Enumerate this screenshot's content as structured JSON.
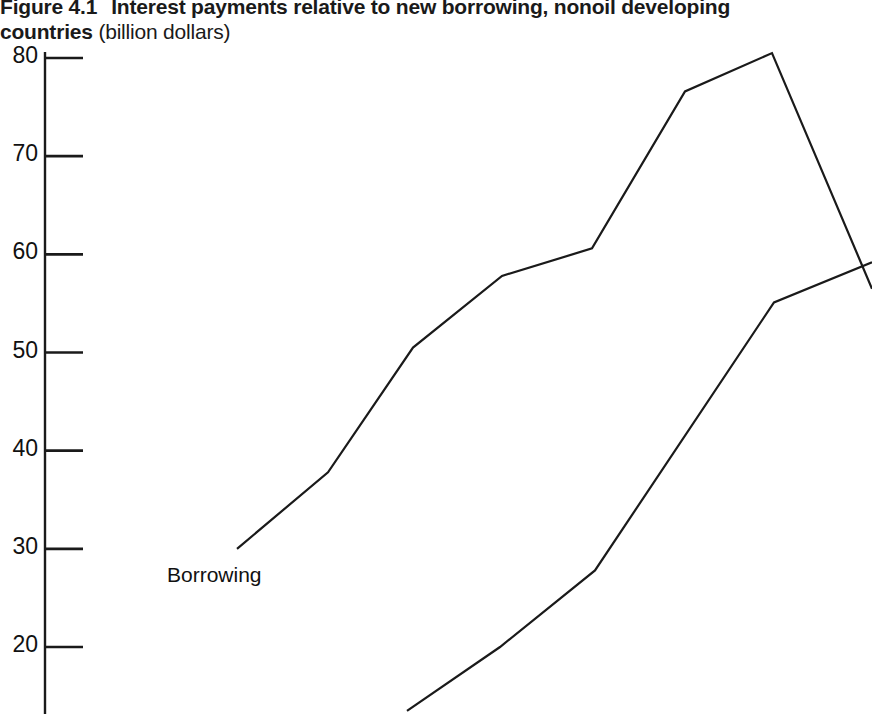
{
  "figure": {
    "number": "Figure 4.1",
    "title_bold_part1": "Interest payments relative to new borrowing, nonoil developing",
    "title_bold_part2": "countries",
    "title_units": "(billion dollars)"
  },
  "axis": {
    "y_ticks": [
      {
        "label": "80",
        "value": 80
      },
      {
        "label": "70",
        "value": 70
      },
      {
        "label": "60",
        "value": 60
      },
      {
        "label": "50",
        "value": 50
      },
      {
        "label": "40",
        "value": 40
      },
      {
        "label": "30",
        "value": 30
      },
      {
        "label": "20",
        "value": 20
      }
    ],
    "y_min_visible": 13,
    "y_max_visible": 81,
    "axis_color": "#1a1a1a"
  },
  "labels": {
    "borrowing": "Borrowing"
  },
  "chart_data": {
    "type": "line",
    "xlabel": "",
    "ylabel": "billion dollars",
    "ylim": [
      13,
      81
    ],
    "grid": false,
    "legend": "inline-label",
    "annotations": [
      "Borrowing"
    ],
    "series": [
      {
        "name": "Borrowing",
        "points": [
          {
            "x": 237,
            "y": 30.0
          },
          {
            "x": 328,
            "y": 37.8
          },
          {
            "x": 413,
            "y": 50.5
          },
          {
            "x": 502,
            "y": 57.8
          },
          {
            "x": 592,
            "y": 60.6
          },
          {
            "x": 685,
            "y": 76.6
          },
          {
            "x": 772,
            "y": 80.5
          },
          {
            "x": 872,
            "y": 56.5
          }
        ]
      },
      {
        "name": "Interest payments",
        "points": [
          {
            "x": 407,
            "y": 13.5
          },
          {
            "x": 500,
            "y": 20.0
          },
          {
            "x": 595,
            "y": 27.8
          },
          {
            "x": 774,
            "y": 55.1
          },
          {
            "x": 872,
            "y": 59.2
          }
        ]
      }
    ]
  }
}
